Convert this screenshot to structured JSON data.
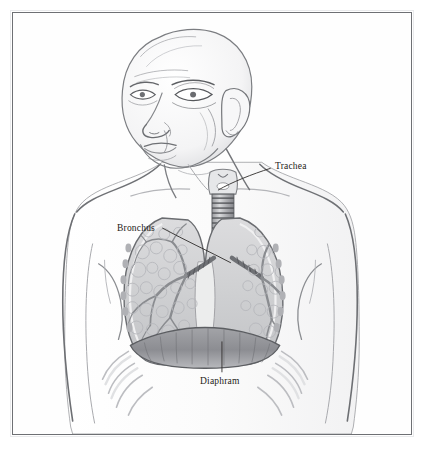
{
  "figure": {
    "style": "pencil-sketch grayscale medical illustration",
    "background_color": "#ffffff",
    "frame_color": "#6e7074",
    "ink_color": "#55575b",
    "label_color": "#1e1b18"
  },
  "labels": [
    {
      "id": "trachea",
      "text": "Trachea",
      "x": 262,
      "y": 149
    },
    {
      "id": "bronchus",
      "text": "Bronchus",
      "x": 104,
      "y": 211
    },
    {
      "id": "diaphram",
      "text": "Diaphram",
      "x": 187,
      "y": 364
    }
  ],
  "leader_lines": [
    {
      "id": "trachea-leader",
      "from": [
        260,
        156
      ],
      "to": [
        205,
        178
      ]
    },
    {
      "id": "bronchus-leader",
      "from": [
        150,
        216
      ],
      "to": [
        218,
        250
      ]
    },
    {
      "id": "diaphram-leader",
      "from": [
        210,
        362
      ],
      "to": [
        210,
        330
      ]
    }
  ],
  "anatomy": {
    "parts": [
      "head",
      "face",
      "ear",
      "neck",
      "larynx",
      "trachea",
      "left-bronchus",
      "right-bronchus",
      "left-lung",
      "right-lung",
      "bronchial-tree",
      "diaphragm",
      "ribcage",
      "shoulders",
      "arms",
      "torso"
    ]
  }
}
